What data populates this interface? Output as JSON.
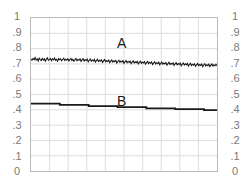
{
  "chart_data": {
    "type": "line",
    "title": "",
    "xlabel": "",
    "ylabel": "",
    "ylim": [
      0,
      1
    ],
    "xlim": [
      0,
      1
    ],
    "grid": true,
    "legend_position": "inline-annotation",
    "y_ticks": [
      1,
      0.9,
      0.8,
      0.7,
      0.6,
      0.5,
      0.4,
      0.3,
      0.2,
      0.1,
      0
    ],
    "y_tick_labels": [
      "1",
      ".9",
      ".8",
      ".7",
      ".6",
      ".5",
      ".4",
      ".3",
      ".2",
      ".1",
      "0"
    ],
    "y_tick_labels_right": [
      "1",
      ".9",
      ".8",
      ".7",
      ".6",
      ".5",
      ".4",
      ".3",
      ".2",
      ".1",
      "0"
    ],
    "x_ticks_unlabeled": 9,
    "annotations": [
      {
        "text": "A",
        "series": "A",
        "x": 0.47,
        "y": 0.79
      },
      {
        "text": "B",
        "series": "B",
        "x": 0.47,
        "y": 0.52
      }
    ],
    "series": [
      {
        "name": "A",
        "label": "A",
        "color": "#1a1a1a",
        "style": "noisy-line",
        "noise_amplitude": 0.012,
        "trend_start": 0.731,
        "trend_end": 0.688,
        "values": [
          0.731,
          0.724,
          0.735,
          0.727,
          0.741,
          0.726,
          0.733,
          0.719,
          0.738,
          0.728,
          0.722,
          0.736,
          0.725,
          0.733,
          0.718,
          0.731,
          0.74,
          0.723,
          0.729,
          0.736,
          0.721,
          0.733,
          0.726,
          0.739,
          0.724,
          0.73,
          0.718,
          0.735,
          0.727,
          0.733,
          0.72,
          0.729,
          0.737,
          0.723,
          0.731,
          0.725,
          0.734,
          0.719,
          0.728,
          0.736,
          0.722,
          0.73,
          0.717,
          0.727,
          0.735,
          0.721,
          0.729,
          0.724,
          0.733,
          0.716,
          0.726,
          0.734,
          0.719,
          0.728,
          0.722,
          0.731,
          0.714,
          0.724,
          0.732,
          0.718,
          0.726,
          0.72,
          0.729,
          0.712,
          0.722,
          0.73,
          0.716,
          0.724,
          0.718,
          0.727,
          0.71,
          0.72,
          0.728,
          0.714,
          0.722,
          0.716,
          0.725,
          0.708,
          0.718,
          0.726,
          0.712,
          0.72,
          0.714,
          0.723,
          0.706,
          0.716,
          0.724,
          0.71,
          0.718,
          0.712,
          0.721,
          0.704,
          0.714,
          0.722,
          0.708,
          0.716,
          0.71,
          0.719,
          0.702,
          0.712,
          0.72,
          0.706,
          0.714,
          0.708,
          0.717,
          0.7,
          0.71,
          0.718,
          0.704,
          0.712,
          0.706,
          0.715,
          0.698,
          0.708,
          0.716,
          0.702,
          0.71,
          0.704,
          0.713,
          0.696,
          0.706,
          0.714,
          0.7,
          0.708,
          0.702,
          0.711,
          0.694,
          0.704,
          0.712,
          0.698,
          0.706,
          0.7,
          0.709,
          0.692,
          0.702,
          0.71,
          0.696,
          0.704,
          0.698,
          0.707,
          0.69,
          0.7,
          0.708,
          0.694,
          0.702,
          0.696,
          0.705,
          0.688,
          0.698,
          0.706,
          0.692,
          0.7,
          0.694,
          0.703,
          0.686,
          0.696,
          0.704,
          0.69,
          0.698,
          0.692,
          0.701,
          0.684,
          0.694,
          0.702,
          0.688,
          0.696,
          0.69,
          0.699,
          0.683,
          0.693,
          0.701,
          0.687,
          0.695,
          0.689,
          0.698,
          0.682,
          0.692,
          0.7,
          0.686,
          0.694,
          0.688,
          0.697,
          0.688
        ]
      },
      {
        "name": "B",
        "label": "B",
        "color": "#1a1a1a",
        "style": "step-line",
        "step_values": [
          0.44,
          0.432,
          0.424,
          0.418,
          0.41,
          0.404,
          0.398
        ],
        "step_x_breaks": [
          0.0,
          0.155,
          0.31,
          0.465,
          0.62,
          0.775,
          0.93,
          1.0
        ]
      }
    ]
  }
}
